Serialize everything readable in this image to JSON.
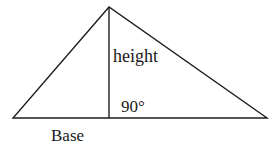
{
  "diagram": {
    "colors": {
      "stroke": "#1e1e1e",
      "text": "#1a1a1a",
      "background": "#ffffff"
    },
    "shape": {
      "type": "triangle",
      "vertices": {
        "apex": [
          109,
          7
        ],
        "left": [
          13,
          118
        ],
        "right": [
          267,
          118
        ]
      },
      "altitude": {
        "from": [
          109,
          7
        ],
        "to": [
          109,
          118
        ]
      }
    },
    "labels": {
      "height": "height",
      "angle": "90°",
      "base": "Base"
    }
  }
}
